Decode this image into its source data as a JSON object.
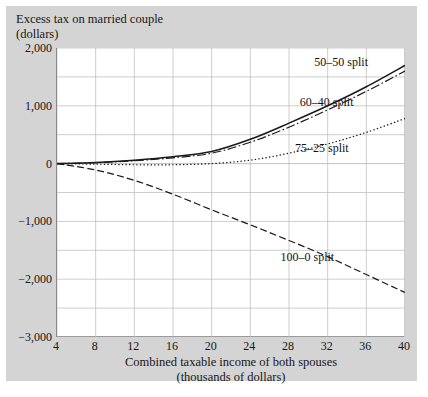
{
  "figure": {
    "title": "Excess tax on married couple\n(dollars)",
    "panel_color": "#d4d4d4",
    "plot_bg": "#ffffff",
    "grid_color": "#b9b9b9",
    "axis_color": "#8a8a8a",
    "line_color": "#1a1a1a"
  },
  "chart_data": {
    "type": "line",
    "title": "Excess tax on married couple (dollars)",
    "xlabel": "Combined taxable income of both spouses (thousands of dollars)",
    "ylabel": "Excess tax on married couple (dollars)",
    "xlim": [
      4,
      40
    ],
    "ylim": [
      -3000,
      2000
    ],
    "xticks": [
      4,
      8,
      12,
      16,
      20,
      24,
      28,
      32,
      36,
      40
    ],
    "yticks": [
      2000,
      1000,
      0,
      -1000,
      -2000,
      -3000
    ],
    "ytick_labels": [
      "2,000",
      "1,000",
      "0",
      "−1,000",
      "−2,000",
      "−3,000"
    ],
    "grid": true,
    "grid_y_step": 500,
    "grid_x_step": 4,
    "legend": "inline-annotations",
    "x": [
      4,
      8,
      12,
      16,
      20,
      24,
      28,
      32,
      36,
      40
    ],
    "series": [
      {
        "name": "50–50 split",
        "style": "solid",
        "values": [
          0,
          20,
          60,
          120,
          210,
          420,
          700,
          1000,
          1330,
          1700
        ],
        "label_x": 33.5,
        "label_y": 1760
      },
      {
        "name": "60–40 split",
        "style": "dashdot",
        "values": [
          0,
          15,
          50,
          100,
          180,
          370,
          630,
          930,
          1250,
          1600
        ],
        "label_x": 32.0,
        "label_y": 1060
      },
      {
        "name": "75–25 split",
        "style": "dotted",
        "values": [
          0,
          -10,
          -20,
          -20,
          0,
          60,
          180,
          340,
          540,
          780
        ],
        "label_x": 31.5,
        "label_y": 270
      },
      {
        "name": "100–0 split",
        "style": "longdash",
        "values": [
          0,
          -110,
          -290,
          -530,
          -800,
          -1060,
          -1330,
          -1610,
          -1920,
          -2230
        ],
        "label_x": 30.0,
        "label_y": -1620
      }
    ],
    "annotations": [
      {
        "text": "50–50 split",
        "x": 33.5,
        "y": 1760
      },
      {
        "text": "60–40 split",
        "x": 32.0,
        "y": 1060
      },
      {
        "text": "75–25 split",
        "x": 31.5,
        "y": 270
      },
      {
        "text": "100–0 split",
        "x": 30.0,
        "y": -1620
      }
    ]
  }
}
